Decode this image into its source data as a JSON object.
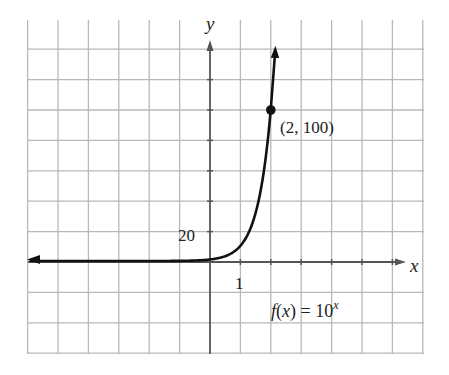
{
  "chart_data": {
    "type": "line",
    "title": "",
    "function_label": "f(x) = 10^x",
    "function_label_parts": {
      "f": "f",
      "open": "(",
      "x": "x",
      "close_eq": ") = 10",
      "exp": "x"
    },
    "xlabel": "x",
    "ylabel": "y",
    "x_tick_labels": [
      {
        "value": 1,
        "label": "1"
      }
    ],
    "y_tick_labels": [
      {
        "value": 20,
        "label": "20"
      }
    ],
    "x_grid_unit": 1,
    "y_grid_unit": 20,
    "xlim": [
      -6,
      7
    ],
    "ylim": [
      -60,
      160
    ],
    "grid": true,
    "series": [
      {
        "name": "f(x) = 10^x",
        "x": [
          -6,
          -4,
          -2,
          0,
          0.5,
          1,
          1.25,
          1.5,
          1.75,
          2,
          2.1
        ],
        "values": [
          1e-06,
          0.0001,
          0.01,
          1,
          3.16,
          10,
          17.8,
          31.6,
          56.2,
          100,
          125.9
        ]
      }
    ],
    "annotations": [
      {
        "point": [
          2,
          100
        ],
        "label": "(2, 100)",
        "marker": "filled-circle"
      }
    ]
  },
  "colors": {
    "grid": "#b8b8b8",
    "axis": "#555555",
    "curve": "#111111",
    "background": "#ffffff"
  }
}
